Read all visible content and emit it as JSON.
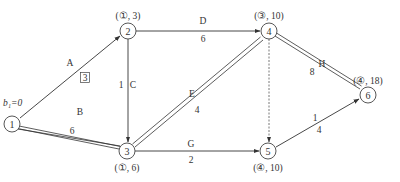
{
  "diagram": {
    "type": "network-schedule",
    "start_label": "b₁=0",
    "nodes": [
      {
        "id": "1",
        "label": "1",
        "x": 12,
        "y": 124,
        "annotation": ""
      },
      {
        "id": "2",
        "label": "2",
        "x": 128,
        "y": 31,
        "annotation": "(①, 3)"
      },
      {
        "id": "3",
        "label": "3",
        "x": 127,
        "y": 151,
        "annotation": "(①, 6)"
      },
      {
        "id": "4",
        "label": "4",
        "x": 269,
        "y": 31,
        "annotation": "(③, 10)"
      },
      {
        "id": "5",
        "label": "5",
        "x": 268,
        "y": 151,
        "annotation": "(④, 10)"
      },
      {
        "id": "6",
        "label": "6",
        "x": 368,
        "y": 95,
        "annotation": "(④, 18)"
      }
    ],
    "edges": [
      {
        "from": "1",
        "to": "2",
        "activity": "A",
        "duration": "3",
        "duration_boxed": true,
        "style": "solid"
      },
      {
        "from": "1",
        "to": "3",
        "activity": "B",
        "duration": "6",
        "style": "double"
      },
      {
        "from": "2",
        "to": "3",
        "activity": "C",
        "duration": "1",
        "style": "solid"
      },
      {
        "from": "2",
        "to": "4",
        "activity": "D",
        "duration": "6",
        "style": "solid"
      },
      {
        "from": "3",
        "to": "4",
        "activity": "E",
        "duration": "4",
        "style": "double"
      },
      {
        "from": "3",
        "to": "5",
        "activity": "G",
        "duration": "2",
        "style": "solid"
      },
      {
        "from": "4",
        "to": "5",
        "activity": "",
        "duration": "",
        "style": "dashed"
      },
      {
        "from": "4",
        "to": "6",
        "activity": "H",
        "duration": "8",
        "style": "double"
      },
      {
        "from": "5",
        "to": "6",
        "activity": "I",
        "duration": "4",
        "style": "solid"
      }
    ]
  }
}
